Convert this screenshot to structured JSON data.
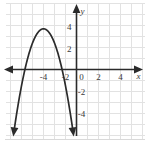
{
  "figure": {
    "title": "",
    "background_color": "#ffffff",
    "grid_color": "#e2e2e2",
    "axis_color": "#2b2b2b",
    "curve_color": "#2b2b2b"
  },
  "chart_data": {
    "type": "line",
    "title": "",
    "xlabel": "x",
    "ylabel": "y",
    "xlim": [
      -6.9,
      6.4
    ],
    "ylim": [
      -6.3,
      7.0
    ],
    "grid": true,
    "grid_step": 1,
    "legend": "none",
    "x_ticks": [
      -4,
      -2,
      0,
      2,
      4
    ],
    "x_tick_labels": [
      "-4",
      "-2",
      "0",
      "2",
      "4"
    ],
    "y_ticks": [
      4,
      2,
      -2,
      -4
    ],
    "y_tick_labels": [
      "4",
      "2",
      "-2",
      "-4"
    ],
    "series": [
      {
        "name": "parabola",
        "shape": "downward parabola",
        "equation": "y = -1.3(x + 3)^2 + 3.7",
        "vertex": [
          -3,
          3.7
        ],
        "roots": [
          -4.69,
          -1.31
        ],
        "y_intercept": -8.0,
        "opens": "down",
        "arrow_ends": [
          "down-left",
          "down-right"
        ],
        "x": [
          -4.95,
          -4.6,
          -4.2,
          -3.8,
          -3.4,
          -3.0,
          -2.6,
          -2.2,
          -1.8,
          -1.4,
          -1.0,
          -0.6,
          -0.2,
          0.0
        ],
        "values": [
          -0.9,
          0.4,
          1.83,
          2.87,
          3.49,
          3.7,
          3.49,
          2.87,
          1.83,
          0.4,
          -0.42,
          -3.01,
          -5.5,
          -8.0
        ]
      }
    ],
    "annotations": [
      {
        "name": "x-axis-arrow-left",
        "at": [
          -6.6,
          0
        ]
      },
      {
        "name": "x-axis-arrow-right",
        "at": [
          6.1,
          0
        ]
      },
      {
        "name": "y-axis-arrow-top",
        "at": [
          0,
          6.6
        ]
      }
    ]
  }
}
